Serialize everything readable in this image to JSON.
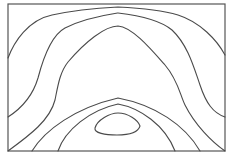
{
  "diagram": {
    "type": "contour-plot",
    "frame": {
      "x": 8,
      "y": 4,
      "width": 217,
      "height": 147
    },
    "colors": {
      "line": "#4a4a4a",
      "frame": "#555555",
      "background": "#ffffff"
    },
    "contours": [
      {
        "id": "A",
        "description": "outer top arch, left edge to right edge",
        "d": "M8,58 C14,42 28,20 52,15 C75,10 100,8 118,7 C140,8 165,11 178,15 C200,22 217,40 225,55"
      },
      {
        "id": "B",
        "description": "second arch, left edge to right edge",
        "d": "M8,117 C22,108 33,95 38,78 C44,55 52,35 65,28 C85,18 105,15 118,13 C135,15 160,20 172,30 C188,45 194,68 200,85 C206,103 213,113 225,117"
      },
      {
        "id": "C",
        "description": "inner peaked arch, bottom-left corner to bottom-right corner",
        "d": "M8,151 C30,135 50,120 55,100 C58,85 60,72 68,62 C85,42 105,26 118,26 C132,27 150,48 165,65 C178,80 180,95 185,105 C195,125 212,142 225,151"
      },
      {
        "id": "D",
        "description": "lower arch",
        "d": "M32,151 C45,130 75,108 118,98 C155,105 185,125 200,151"
      },
      {
        "id": "E",
        "description": "inner lower arch",
        "d": "M58,151 C65,130 90,110 118,104 C140,108 165,125 175,151"
      },
      {
        "id": "F",
        "description": "closed central loop",
        "d": "M95,128 C97,120 110,113 118,113 C128,113 138,120 140,126 C138,133 128,135 117,135 C105,135 94,133 95,128 Z"
      }
    ]
  }
}
